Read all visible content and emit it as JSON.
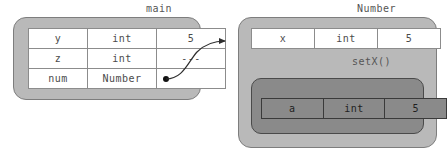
{
  "diagram": {
    "title_left": "main",
    "title_right": "Number",
    "method_label": "setX()",
    "pointer_glyph": "●",
    "colors": {
      "outer_box_fill": "#b9b9b9",
      "outer_box_border": "#7d7d7d",
      "inner_box_fill": "#8a8a8a",
      "inner_box_border": "#4a4a4a",
      "cell_fill": "#ffffff",
      "cell_border": "#8c8c8c",
      "text": "#4b4b4b",
      "arrow": "#3a3a3a",
      "background": "#ffffff"
    }
  },
  "main_frame": {
    "label": "main",
    "rows": [
      {
        "name": "y",
        "type": "int",
        "value": "5"
      },
      {
        "name": "z",
        "type": "int",
        "value": "---"
      },
      {
        "name": "num",
        "type": "Number",
        "value": ""
      }
    ]
  },
  "number_object": {
    "label": "Number",
    "rows": [
      {
        "name": "x",
        "type": "int",
        "value": "5"
      }
    ],
    "method": {
      "label": "setX()",
      "rows": [
        {
          "name": "a",
          "type": "int",
          "value": "5"
        }
      ]
    }
  }
}
